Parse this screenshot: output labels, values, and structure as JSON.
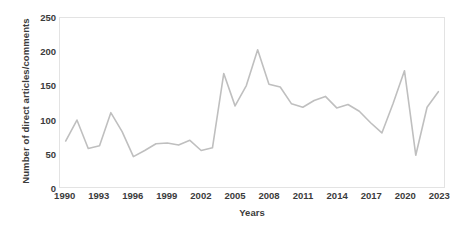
{
  "chart_data": {
    "type": "line",
    "title": "",
    "xlabel": "Years",
    "ylabel": "Number of direct articles/comments",
    "xlim": [
      1989.5,
      2023.5
    ],
    "ylim": [
      0,
      250
    ],
    "yticks": [
      0,
      50,
      100,
      150,
      200,
      250
    ],
    "xticks": [
      1990,
      1993,
      1996,
      1999,
      2002,
      2005,
      2008,
      2011,
      2014,
      2017,
      2020,
      2023
    ],
    "grid": false,
    "legend": null,
    "line_color": "#bfbfbf",
    "axis_color": "#e3e3e3",
    "text_color": "#3b3b3b",
    "x": [
      1990,
      1991,
      1992,
      1993,
      1994,
      1995,
      1996,
      1997,
      1998,
      1999,
      2000,
      2001,
      2002,
      2003,
      2004,
      2005,
      2006,
      2007,
      2008,
      2009,
      2010,
      2011,
      2012,
      2013,
      2014,
      2015,
      2016,
      2017,
      2018,
      2019,
      2020,
      2021,
      2022,
      2023
    ],
    "values": [
      68,
      99,
      57,
      61,
      110,
      82,
      45,
      54,
      64,
      65,
      62,
      69,
      54,
      58,
      168,
      120,
      150,
      203,
      152,
      148,
      123,
      118,
      128,
      134,
      117,
      122,
      112,
      95,
      80,
      124,
      172,
      47,
      118,
      141
    ],
    "series": [
      {
        "name": "Number of direct articles/comments",
        "values": [
          68,
          99,
          57,
          61,
          110,
          82,
          45,
          54,
          64,
          65,
          62,
          69,
          54,
          58,
          168,
          120,
          150,
          203,
          152,
          148,
          123,
          118,
          128,
          134,
          117,
          122,
          112,
          95,
          80,
          124,
          172,
          47,
          118,
          141
        ]
      }
    ],
    "annotations": []
  }
}
